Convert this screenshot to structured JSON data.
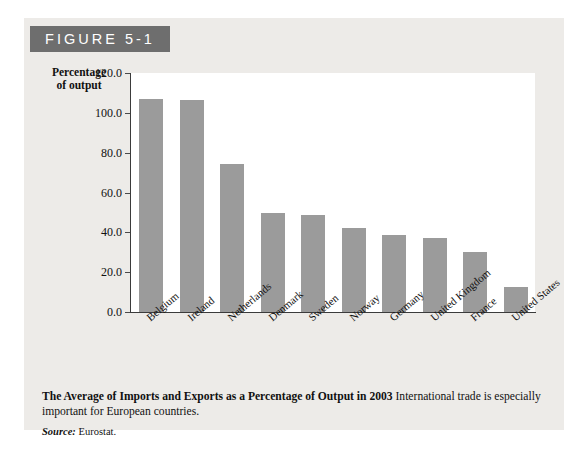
{
  "figure": {
    "badge_label": "FIGURE 5-1",
    "caption_title": "The Average of Imports and Exports as a Percentage of Output in 2003",
    "caption_body": " International trade is especially important for European countries.",
    "source_label": "Source:",
    "source_value": " Eurostat."
  },
  "colors": {
    "badge_background": "#6e6e6e",
    "panel_background": "#edebe8",
    "plot_background": "#ffffff",
    "bar_fill": "#9b9b9b",
    "axis_line": "#3b3b3b",
    "text": "#111111"
  },
  "chart_data": {
    "type": "bar",
    "title": "The Average of Imports and Exports as a Percentage of Output in 2003",
    "xlabel": "",
    "ylabel": "Percentage of output",
    "ylabel_lines": [
      "Percentage",
      "of output"
    ],
    "ylim": [
      0.0,
      120.0
    ],
    "ytick_step": 20.0,
    "ytick_labels": [
      "120.0",
      "100.0",
      "80.0",
      "60.0",
      "40.0",
      "20.0",
      "0.0"
    ],
    "ytick_values": [
      120.0,
      100.0,
      80.0,
      60.0,
      40.0,
      20.0,
      0.0
    ],
    "grid": false,
    "legend": "none",
    "categories": [
      "Belgium",
      "Ireland",
      "Netherlands",
      "Denmark",
      "Sweden",
      "Norway",
      "Germany",
      "United Kingdom",
      "France",
      "United States"
    ],
    "values": [
      106.8,
      106.3,
      74.5,
      49.8,
      48.5,
      42.0,
      38.8,
      37.0,
      30.0,
      12.6
    ],
    "series": [
      {
        "name": "Average of imports and exports as a percentage of output",
        "values": [
          106.8,
          106.3,
          74.5,
          49.8,
          48.5,
          42.0,
          38.8,
          37.0,
          30.0,
          12.6
        ]
      }
    ]
  }
}
